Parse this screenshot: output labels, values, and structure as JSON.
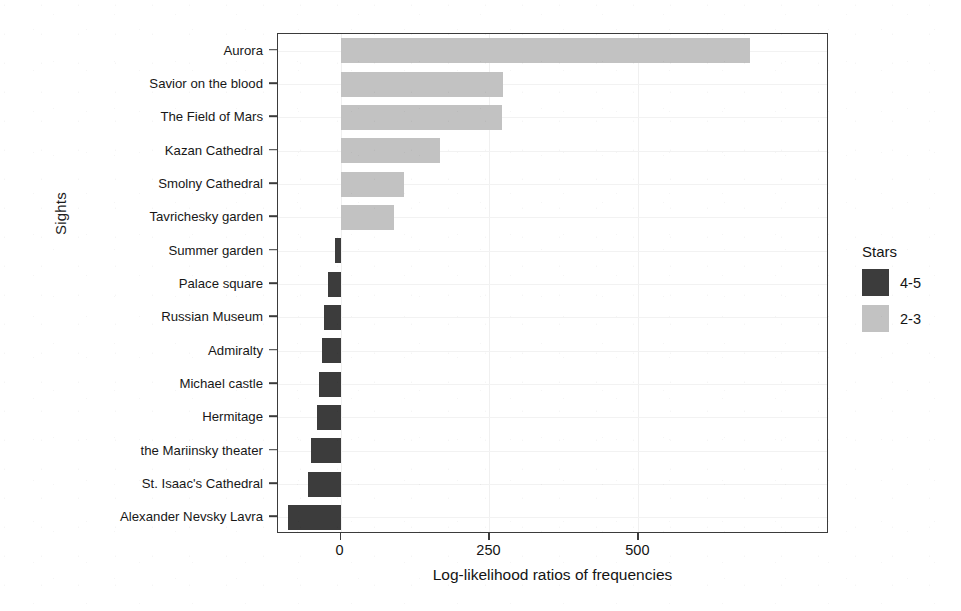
{
  "chart_data": {
    "type": "bar",
    "orientation": "horizontal",
    "title": "",
    "xlabel": "Log-likelihood ratios of frequencies",
    "ylabel": "Sights",
    "categories": [
      "Aurora",
      "Savior on the blood",
      "The Field of Mars",
      "Kazan Cathedral",
      "Smolny Cathedral",
      "Tavrichesky garden",
      "Summer garden",
      "Palace square",
      "Russian Museum",
      "Admiralty",
      "Michael castle",
      "Hermitage",
      "the Mariinsky theater",
      "St. Isaac's Cathedral",
      "Alexander Nevsky Lavra"
    ],
    "values": [
      688,
      272,
      271,
      167,
      107,
      89,
      -10,
      -21,
      -28,
      -31,
      -36,
      -39,
      -50,
      -55,
      -88
    ],
    "xlim": [
      -105,
      820
    ],
    "xticks": [
      0,
      250,
      500
    ],
    "xtick_labels": [
      "0",
      "250",
      "500"
    ],
    "grid": true,
    "legend": {
      "title": "Stars",
      "position": "right",
      "entries": [
        {
          "label": "4-5",
          "color": "#3c3c3c"
        },
        {
          "label": "2-3",
          "color": "#c2c2c2"
        }
      ]
    },
    "series": [
      {
        "name": "2-3",
        "color": "#c2c2c2",
        "applies_to": [
          "Aurora",
          "Savior on the blood",
          "The Field of Mars",
          "Kazan Cathedral",
          "Smolny Cathedral",
          "Tavrichesky garden"
        ]
      },
      {
        "name": "4-5",
        "color": "#3c3c3c",
        "applies_to": [
          "Summer garden",
          "Palace square",
          "Russian Museum",
          "Admiralty",
          "Michael castle",
          "Hermitage",
          "the Mariinsky theater",
          "St. Isaac's Cathedral",
          "Alexander Nevsky Lavra"
        ]
      }
    ]
  }
}
